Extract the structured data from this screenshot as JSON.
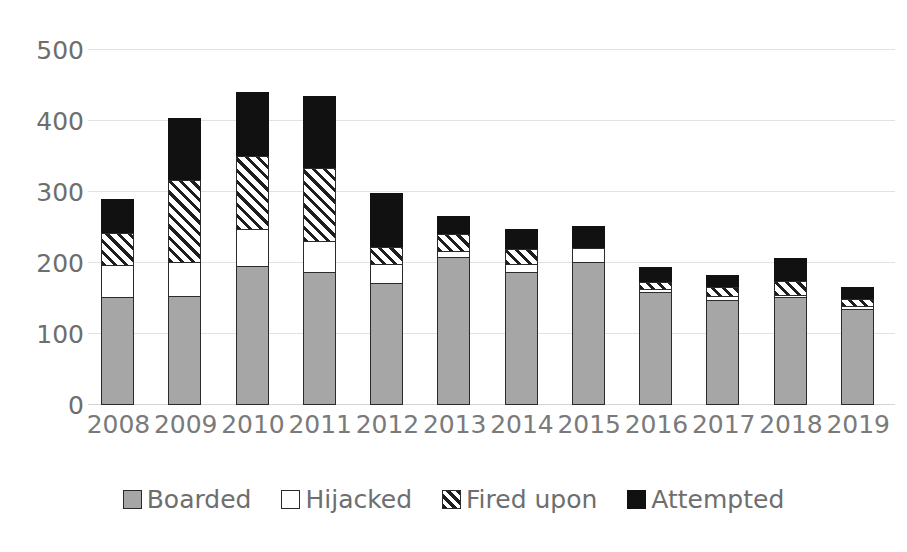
{
  "chart_data": {
    "type": "bar",
    "subtype": "stacked-vertical",
    "title": "",
    "subtitle": "",
    "xlabel": "",
    "ylabel": "",
    "categories": [
      "2008",
      "2009",
      "2010",
      "2011",
      "2012",
      "2013",
      "2014",
      "2015",
      "2016",
      "2017",
      "2018",
      "2019"
    ],
    "series": [
      {
        "name": "Boarded",
        "color": "#a6a6a6",
        "fill": "solid-gray",
        "values": [
          152,
          153,
          196,
          187,
          172,
          209,
          187,
          201,
          159,
          148,
          152,
          135
        ]
      },
      {
        "name": "Hijacked",
        "color": "#ffffff",
        "fill": "solid-white",
        "values": [
          47,
          50,
          54,
          45,
          28,
          10,
          13,
          22,
          6,
          7,
          5,
          6
        ]
      },
      {
        "name": "Fired upon",
        "color": "#1e1e1e",
        "fill": "diagonal-hatch",
        "values": [
          46,
          117,
          103,
          104,
          26,
          25,
          22,
          0,
          11,
          14,
          20,
          11
        ]
      },
      {
        "name": "Attempted",
        "color": "#111111",
        "fill": "solid-black",
        "values": [
          49,
          88,
          92,
          103,
          77,
          27,
          30,
          32,
          22,
          19,
          34,
          18
        ]
      }
    ],
    "totals": [
      294,
      408,
      445,
      439,
      303,
      271,
      252,
      255,
      198,
      188,
      211,
      170
    ],
    "ylim": [
      0,
      500
    ],
    "ytick_values": [
      0,
      100,
      200,
      300,
      400,
      500
    ],
    "ytick_labels": [
      "0",
      "100",
      "200",
      "300",
      "400",
      "500"
    ],
    "grid": true,
    "grid_axis": "y",
    "legend_position": "bottom",
    "annotations": []
  },
  "axes": {
    "y": {
      "ticks": [
        {
          "label": "500",
          "value": 500
        },
        {
          "label": "400",
          "value": 400
        },
        {
          "label": "300",
          "value": 300
        },
        {
          "label": "200",
          "value": 200
        },
        {
          "label": "100",
          "value": 100
        },
        {
          "label": "0",
          "value": 0
        }
      ]
    },
    "x": {
      "ticks": [
        {
          "label": "2008"
        },
        {
          "label": "2009"
        },
        {
          "label": "2010"
        },
        {
          "label": "2011"
        },
        {
          "label": "2012"
        },
        {
          "label": "2013"
        },
        {
          "label": "2014"
        },
        {
          "label": "2015"
        },
        {
          "label": "2016"
        },
        {
          "label": "2017"
        },
        {
          "label": "2018"
        },
        {
          "label": "2019"
        }
      ]
    }
  },
  "legend": {
    "items": [
      {
        "label": "Boarded",
        "swatch": "solid-gray-swatch"
      },
      {
        "label": "Hijacked",
        "swatch": "solid-white-swatch"
      },
      {
        "label": "Fired upon",
        "swatch": "hatched-swatch"
      },
      {
        "label": "Attempted",
        "swatch": "solid-black-swatch"
      }
    ]
  },
  "colors": {
    "boarded": "#a6a6a6",
    "hijacked": "#ffffff",
    "fired_upon": "#1e1e1e",
    "attempted": "#111111",
    "gridline": "#e2e2e2",
    "tick_text": "#6e6e6e"
  }
}
